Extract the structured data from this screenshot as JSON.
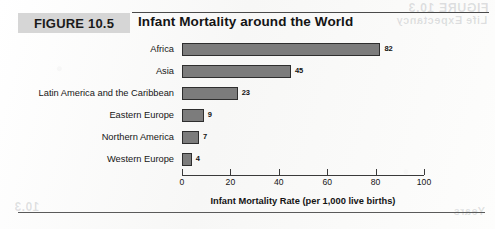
{
  "figure": {
    "tag": "FIGURE 10.5",
    "title": "Infant Mortality around the World"
  },
  "bleed_through": {
    "top_line1": "FIGURE 10.3",
    "top_line2": "Life Expectancy",
    "bottom_left": "10.3",
    "bottom_right": "Years"
  },
  "chart_data": {
    "type": "bar",
    "orientation": "horizontal",
    "title": "Infant Mortality around the World",
    "categories": [
      "Africa",
      "Asia",
      "Latin America and the Caribbean",
      "Eastern Europe",
      "Northern America",
      "Western Europe"
    ],
    "values": [
      82,
      45,
      23,
      9,
      7,
      4
    ],
    "data_labels": [
      "82",
      "45",
      "23",
      "9",
      "7",
      "4"
    ],
    "xlabel": "Infant Mortality Rate (per 1,000 live births)",
    "ylabel": "",
    "xlim": [
      0,
      100
    ],
    "xticks": [
      0,
      20,
      40,
      60,
      80,
      100
    ],
    "xtick_labels": [
      "0",
      "20",
      "40",
      "60",
      "80",
      "100"
    ],
    "grid": false,
    "legend": null,
    "bar_color": "#7c7c7c",
    "bar_border_color": "#2e2e2e"
  }
}
